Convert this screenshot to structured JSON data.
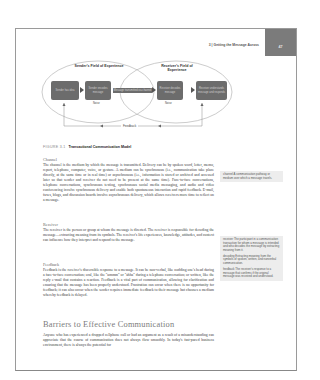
{
  "header": {
    "running_title": "3 | Getting the Message Across",
    "page_number": "47",
    "tab_color": "#7b7b7b"
  },
  "figure": {
    "sender_field": "Sender's Field of Experience",
    "receiver_field": "Receiver's Field of Experience",
    "boxes": [
      {
        "id": "sender-idea",
        "label": "Sender has idea"
      },
      {
        "id": "sender-encodes",
        "label": "Sender encodes message"
      },
      {
        "id": "receiver-decodes",
        "label": "Receiver decodes message"
      },
      {
        "id": "receiver-responds",
        "label": "Receiver understands message and responds"
      }
    ],
    "channel_label": "Message transmitted via channel",
    "noise_label": "Noise",
    "feedback_label": "Feedback",
    "box_color": "#6c6c6c",
    "caption_number": "FIGURE 3.1",
    "caption_title": "Transactional Communication Model"
  },
  "sections": [
    {
      "heading": "Channel",
      "text": "The channel is the medium by which the message is transmitted. Delivery can be by spoken word, letter, memo, report, telephone, computer, voice, or gesture. A medium can be synchronous (i.e., communication take place directly, at the same time or in real time) or asynchronous (i.e., information is stored or archived and accessed later so that sender and receiver do not need to be present at the same time). Face-to-face conversations, telephone conversations, synchronous texting, synchronous social media messaging, and audio and video conferencing involve synchronous delivery and enable both spontaneous interaction and rapid feedback. E-mail, faxes, blogs, and discussion boards involve asynchronous delivery, which allows receivers more time to reflect on a message."
    },
    {
      "heading": "Receiver",
      "text": "The receiver is the person or group at whom the message is directed. The receiver is responsible for decoding the message—extracting meaning from its symbols. The receiver's life experiences, knowledge, attitudes, and context can influence how they interpret and respond to the message."
    },
    {
      "heading": "Feedback",
      "text": "Feedback is the receiver's discernible response to a message. It can be non-verbal, like nodding one's head during a face-to-face conversation; oral, like the \"ummm\" or \"ahha\" during a telephone conversation; or written, like the reply e-mail that contains a reaction. Feedback is a vital part of communication, allowing for clarification and ensuring that the message has been properly understood. Frustration can occur when there is no opportunity for feedback; it can also occur when the sender requires immediate feedback to their message but chooses a medium whereby feedback is delayed."
    }
  ],
  "barriers": {
    "heading": "Barriers to Effective Communication",
    "text": "Anyone who has experienced a dropped cellphone call or had an argument as a result of a misunderstanding can appreciate that the course of communication does not always flow smoothly. In today's fast-paced business environment, there is always the potential for"
  },
  "glossary": [
    {
      "term": "channel",
      "definition": "A communication pathway or medium over which a message travels."
    },
    {
      "term": "receiver",
      "definition": "The participant in a communication transaction for whom a message is intended and who decodes the message by extracting meaning from it."
    },
    {
      "term": "decoding",
      "definition": "Extracting meaning from the symbols of spoken, written, and nonverbal communication."
    },
    {
      "term": "feedback",
      "definition": "The receiver's response to a message that confirms if the original message was received and understood."
    }
  ]
}
